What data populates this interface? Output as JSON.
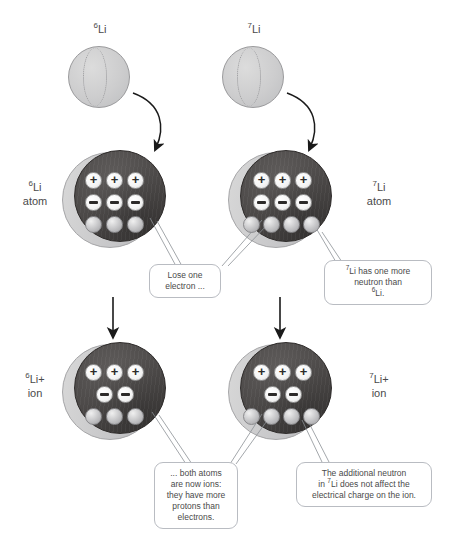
{
  "diagram": {
    "background": "#ffffff",
    "colors": {
      "core": "#4a4746",
      "crescent": "#c6c6c8",
      "neutron": "#c9c9cb",
      "proton_bg": "#ffffff",
      "electron_bg": "#ffffff",
      "text": "#4a4a4a",
      "callout_border": "#b9bcc2",
      "arrow": "#1a1a1a"
    }
  },
  "top_labels": [
    {
      "id": "li6",
      "mass": "6",
      "symbol": "Li"
    },
    {
      "id": "li7",
      "mass": "7",
      "symbol": "Li"
    }
  ],
  "side_labels": [
    {
      "id": "li6-atom",
      "line1_mass": "6",
      "line1_symbol": "Li",
      "line2": "atom"
    },
    {
      "id": "li7-atom",
      "line1_mass": "7",
      "line1_symbol": "Li",
      "line2": "atom"
    },
    {
      "id": "li6-ion",
      "line1_mass": "6",
      "line1_symbol": "Li+",
      "line2": "ion"
    },
    {
      "id": "li7-ion",
      "line1_mass": "7",
      "line1_symbol": "Li+",
      "line2": "ion"
    }
  ],
  "particles": {
    "proton_glyph": "+",
    "electron_glyph": "−",
    "neutron_glyph": ""
  },
  "atoms": [
    {
      "id": "li6-atom",
      "protons": 3,
      "electrons": 3,
      "neutrons": 3
    },
    {
      "id": "li7-atom",
      "protons": 3,
      "electrons": 3,
      "neutrons": 4
    },
    {
      "id": "li6-ion",
      "protons": 3,
      "electrons": 2,
      "neutrons": 3
    },
    {
      "id": "li7-ion",
      "protons": 3,
      "electrons": 2,
      "neutrons": 4
    }
  ],
  "callouts": {
    "lose_electron": {
      "id": "lose-one-electron",
      "lines": [
        "Lose one",
        "electron ..."
      ]
    },
    "extra_neutron": {
      "id": "li7-extra-neutron",
      "line1_pre": "",
      "line1_mass": "7",
      "line1_rest": "Li has one more",
      "line2": "neutron than",
      "line3_mass": "6",
      "line3_rest": "Li."
    },
    "both_ions": {
      "id": "both-atoms-are-ions",
      "lines": [
        "... both atoms",
        "are now ions:",
        "they have more",
        "protons than",
        "electrons."
      ]
    },
    "neutron_no_charge": {
      "id": "neutron-does-not-affect-charge",
      "line1": "The additional neutron",
      "line2_pre": "in ",
      "line2_mass": "7",
      "line2_rest": "Li does not affect the",
      "line3": "electrical charge on the ion."
    }
  }
}
